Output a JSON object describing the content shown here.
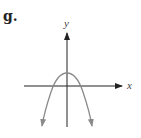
{
  "figure": {
    "part_label": "g.",
    "x_axis_label": "x",
    "y_axis_label": "y",
    "curve": {
      "type": "downward-opening parabola",
      "vertex": "above x-axis on y-axis",
      "ends": "arrows pointing downward on both sides"
    },
    "colors": {
      "axes": "#222222",
      "curve": "#8a8a8a",
      "text": "#222222"
    }
  }
}
